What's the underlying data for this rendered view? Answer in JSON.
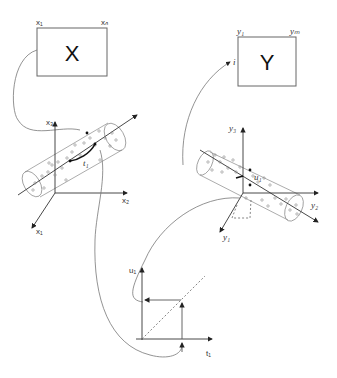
{
  "diagram": {
    "x_block": {
      "label": "X",
      "left_index": "x₁",
      "right_index": "xₙ"
    },
    "y_block": {
      "label": "Y",
      "left_index": "y₁",
      "right_index": "yₘ",
      "entry_mark": "i"
    },
    "x_space": {
      "axes": {
        "vertical": "x₃",
        "horizontal": "x₂",
        "depth": "x₁"
      },
      "score_label": "t₁"
    },
    "y_space": {
      "axes": {
        "vertical": "y₃",
        "horizontal": "y₂",
        "depth": "y₁"
      },
      "score_label": "u₁"
    },
    "inner_relation": {
      "y_axis": "u₁",
      "x_axis": "t₁"
    }
  },
  "colors": {
    "line": "#555555",
    "curve": "#777777",
    "text": "#111111"
  }
}
